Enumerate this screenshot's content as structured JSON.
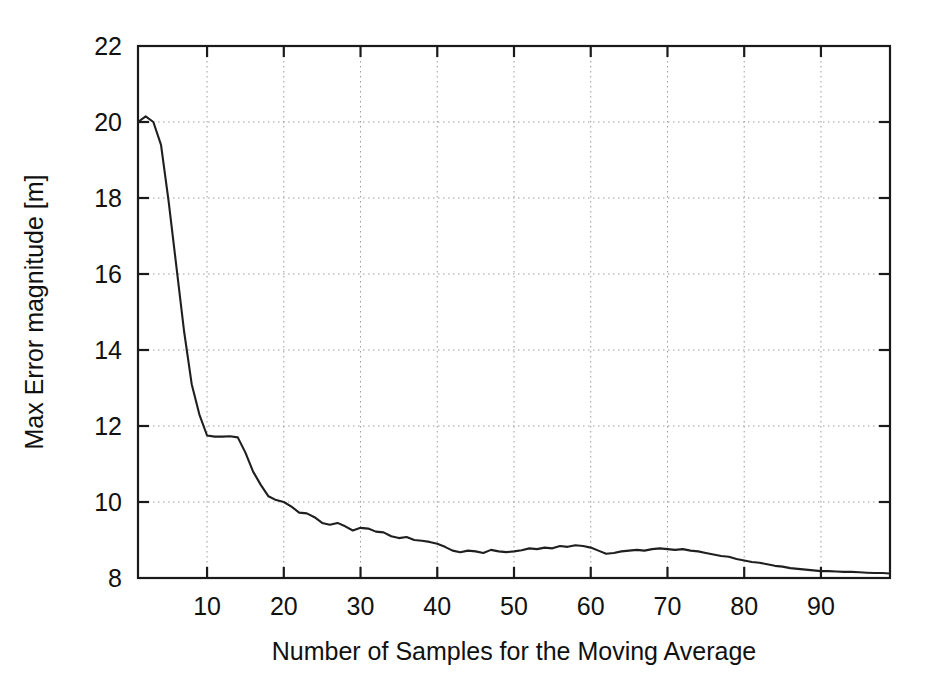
{
  "chart_data": {
    "type": "line",
    "title": "",
    "xlabel": "Number of Samples for the Moving Average",
    "ylabel": "Max Error magnitude [m]",
    "xlim": [
      1,
      99
    ],
    "ylim": [
      8,
      22
    ],
    "xticks": [
      10,
      20,
      30,
      40,
      50,
      60,
      70,
      80,
      90
    ],
    "yticks": [
      8,
      10,
      12,
      14,
      16,
      18,
      20,
      22
    ],
    "grid": true,
    "legend": null,
    "line_color": "#1f1f1f",
    "background_color": "#ffffff",
    "series": [
      {
        "name": "Max Error magnitude",
        "x": [
          1,
          2,
          3,
          4,
          5,
          6,
          7,
          8,
          9,
          10,
          11,
          12,
          13,
          14,
          15,
          16,
          17,
          18,
          19,
          20,
          21,
          22,
          23,
          24,
          25,
          26,
          27,
          28,
          29,
          30,
          31,
          32,
          33,
          34,
          35,
          36,
          37,
          38,
          39,
          40,
          41,
          42,
          43,
          44,
          45,
          46,
          47,
          48,
          49,
          50,
          51,
          52,
          53,
          54,
          55,
          56,
          57,
          58,
          59,
          60,
          61,
          62,
          63,
          64,
          65,
          66,
          67,
          68,
          69,
          70,
          71,
          72,
          73,
          74,
          75,
          76,
          77,
          78,
          79,
          80,
          81,
          82,
          83,
          84,
          85,
          86,
          87,
          88,
          89,
          90,
          91,
          92,
          93,
          94,
          95,
          96,
          97,
          98,
          99
        ],
        "y": [
          20.0,
          20.15,
          20.0,
          19.4,
          17.9,
          16.2,
          14.5,
          13.1,
          12.3,
          11.75,
          11.72,
          11.72,
          11.73,
          11.7,
          11.3,
          10.8,
          10.45,
          10.15,
          10.05,
          10.0,
          9.88,
          9.72,
          9.7,
          9.6,
          9.45,
          9.4,
          9.45,
          9.36,
          9.25,
          9.32,
          9.3,
          9.22,
          9.2,
          9.1,
          9.05,
          9.08,
          9.0,
          8.98,
          8.95,
          8.9,
          8.82,
          8.72,
          8.68,
          8.72,
          8.7,
          8.66,
          8.74,
          8.7,
          8.68,
          8.7,
          8.73,
          8.78,
          8.76,
          8.8,
          8.78,
          8.84,
          8.82,
          8.86,
          8.84,
          8.8,
          8.72,
          8.64,
          8.66,
          8.7,
          8.72,
          8.74,
          8.72,
          8.76,
          8.78,
          8.76,
          8.74,
          8.76,
          8.72,
          8.7,
          8.66,
          8.62,
          8.58,
          8.56,
          8.5,
          8.46,
          8.42,
          8.4,
          8.36,
          8.32,
          8.3,
          8.26,
          8.24,
          8.22,
          8.2,
          8.18,
          8.18,
          8.17,
          8.16,
          8.16,
          8.15,
          8.14,
          8.13,
          8.13,
          8.12
        ]
      }
    ]
  },
  "axes": {
    "x_tick_labels": [
      "10",
      "20",
      "30",
      "40",
      "50",
      "60",
      "70",
      "80",
      "90"
    ],
    "y_tick_labels": [
      "8",
      "10",
      "12",
      "14",
      "16",
      "18",
      "20",
      "22"
    ],
    "x_axis_title": "Number of Samples for the Moving Average",
    "y_axis_title": "Max Error magnitude [m]"
  }
}
